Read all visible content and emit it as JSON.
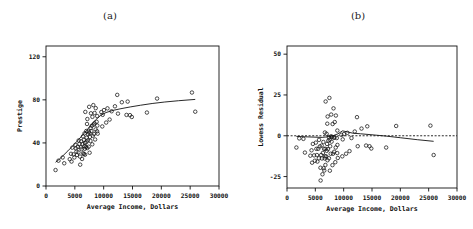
{
  "figure": {
    "background": "#ffffff",
    "ink": "#111111",
    "panel_a_label": "(a)",
    "panel_b_label": "(b)"
  },
  "chart_data": [
    {
      "type": "scatter",
      "title": "(a)",
      "xlabel": "Average Income, Dollars",
      "ylabel": "Prestige",
      "xlim": [
        0,
        30000
      ],
      "ylim": [
        0,
        130
      ],
      "xticks": [
        0,
        5000,
        10000,
        15000,
        20000,
        25000,
        30000
      ],
      "xticklabels": [
        "0",
        "5000",
        "10000",
        "15000",
        "20000",
        "25000",
        "30000"
      ],
      "yticks": [
        0,
        40,
        80,
        120
      ],
      "yticklabels": [
        "0",
        "40",
        "80",
        "120"
      ],
      "grid": false,
      "legend": "none",
      "marker": "open-circle",
      "x": [
        1656,
        2160,
        2896,
        3161,
        4120,
        4330,
        4426,
        4562,
        4783,
        4913,
        5092,
        5180,
        5277,
        5370,
        5511,
        5630,
        5658,
        5795,
        5902,
        5931,
        6033,
        6112,
        6162,
        6258,
        6336,
        6416,
        6462,
        6547,
        6573,
        6664,
        6686,
        6731,
        6776,
        6795,
        6817,
        6914,
        6992,
        7004,
        7059,
        7109,
        7147,
        7170,
        7224,
        7288,
        7396,
        7405,
        7482,
        7534,
        7562,
        7620,
        7709,
        7751,
        7796,
        7869,
        7936,
        8022,
        8049,
        8117,
        8206,
        8258,
        8316,
        8403,
        8425,
        8518,
        8597,
        8622,
        8780,
        8865,
        8880,
        8895,
        8965,
        9593,
        9758,
        9833,
        10051,
        10432,
        10660,
        11030,
        11377,
        11956,
        12351,
        12480,
        13149,
        13959,
        14163,
        14558,
        14878,
        17498,
        19263,
        25308,
        25879
      ],
      "y": [
        14.8,
        23.5,
        26.5,
        21.1,
        24.9,
        29.9,
        22.7,
        35.6,
        29.4,
        26.5,
        38.2,
        34.9,
        32.0,
        28.8,
        36.2,
        31.2,
        42.3,
        39.1,
        27.3,
        19.8,
        35.9,
        41.5,
        34.2,
        25.1,
        38.9,
        46.1,
        30.4,
        42.8,
        29.6,
        37.1,
        48.9,
        34.6,
        29.1,
        39.9,
        68.8,
        36.2,
        51.1,
        40.9,
        44.8,
        57.6,
        35.2,
        62.2,
        42.3,
        48.1,
        50.5,
        36.5,
        73.5,
        49.2,
        30.9,
        45.6,
        41.8,
        53.7,
        67.5,
        51.1,
        55.9,
        38.7,
        64.2,
        46.7,
        75.1,
        56.9,
        48.3,
        58.2,
        67.8,
        43.2,
        52.5,
        72.3,
        59.6,
        50.8,
        64.9,
        56.1,
        48.6,
        68.6,
        55.3,
        66.1,
        70.5,
        58.9,
        72.1,
        61.7,
        69.4,
        74.0,
        84.6,
        67.2,
        77.8,
        66.0,
        78.4,
        65.8,
        64.1,
        68.2,
        81.2,
        86.8,
        69.0
      ],
      "curve_name": "lowess smooth",
      "curve_x": [
        1656,
        2300,
        3000,
        3800,
        4600,
        5400,
        6200,
        7000,
        7800,
        8600,
        9400,
        10400,
        11600,
        13000,
        14600,
        16400,
        18400,
        20600,
        23000,
        25879
      ],
      "curve_y": [
        22.0,
        24.8,
        28.4,
        32.6,
        37.0,
        41.6,
        46.4,
        51.4,
        56.6,
        61.4,
        65.2,
        68.2,
        70.2,
        71.8,
        73.4,
        75.0,
        76.6,
        78.0,
        79.2,
        80.4
      ]
    },
    {
      "type": "scatter",
      "title": "(b)",
      "xlabel": "Average Income, Dollars",
      "ylabel": "Lowess Residual",
      "xlim": [
        0,
        30000
      ],
      "ylim": [
        -32,
        55
      ],
      "xticks": [
        0,
        5000,
        10000,
        15000,
        20000,
        25000,
        30000
      ],
      "xticklabels": [
        "0",
        "5000",
        "10000",
        "15000",
        "20000",
        "25000",
        "30000"
      ],
      "yticks": [
        -25,
        0,
        25,
        50
      ],
      "yticklabels": [
        "-25",
        "0",
        "25",
        "50"
      ],
      "grid": false,
      "legend": "none",
      "marker": "open-circle",
      "reference_line": {
        "y": 0,
        "style": "dashed"
      },
      "x": [
        1656,
        2160,
        2896,
        3161,
        4120,
        4330,
        4426,
        4562,
        4783,
        4913,
        5092,
        5180,
        5277,
        5370,
        5511,
        5630,
        5658,
        5795,
        5902,
        5931,
        6033,
        6112,
        6162,
        6258,
        6336,
        6416,
        6462,
        6547,
        6573,
        6664,
        6686,
        6731,
        6776,
        6795,
        6817,
        6914,
        6992,
        7004,
        7059,
        7109,
        7147,
        7170,
        7224,
        7288,
        7396,
        7405,
        7482,
        7534,
        7562,
        7620,
        7709,
        7751,
        7796,
        7869,
        7936,
        8022,
        8049,
        8117,
        8206,
        8258,
        8316,
        8403,
        8425,
        8518,
        8597,
        8622,
        8780,
        8865,
        8880,
        8895,
        8965,
        9593,
        9758,
        9833,
        10051,
        10432,
        10660,
        11030,
        11377,
        11956,
        12351,
        12480,
        13149,
        13959,
        14163,
        14558,
        14878,
        17498,
        19263,
        25308,
        25879
      ],
      "y": [
        -7.2,
        -1.6,
        -1.9,
        -10.3,
        -12.2,
        -8.9,
        -16.5,
        -5.0,
        -12.0,
        -15.3,
        -4.2,
        -8.0,
        -11.8,
        -15.8,
        -8.0,
        -13.8,
        -2.5,
        -6.5,
        -19.6,
        -27.4,
        -11.8,
        -6.0,
        -13.9,
        -23.6,
        -10.5,
        -3.8,
        -19.9,
        -8.0,
        -21.3,
        -13.9,
        2.0,
        -12.6,
        -17.9,
        -8.0,
        21.0,
        -12.6,
        1.2,
        -9.2,
        -5.0,
        7.4,
        -15.0,
        11.8,
        -8.2,
        -3.0,
        -1.0,
        -13.8,
        23.2,
        -2.5,
        -21.4,
        -6.4,
        -11.0,
        -0.4,
        13.0,
        -3.6,
        -0.6,
        -18.0,
        7.2,
        -11.0,
        16.8,
        -1.2,
        -9.8,
        -1.1,
        8.4,
        -16.2,
        -7.2,
        12.4,
        -1.4,
        -10.6,
        3.2,
        -5.6,
        -13.6,
        0.6,
        -12.6,
        -2.2,
        1.0,
        -11.0,
        1.8,
        -9.4,
        -1.4,
        2.6,
        11.4,
        -6.4,
        4.4,
        -6.0,
        5.8,
        -6.4,
        -7.8,
        -7.2,
        6.0,
        6.2,
        -11.8
      ],
      "curve_name": "lowess smooth of residuals",
      "curve_x": [
        1656,
        3000,
        4600,
        6200,
        7800,
        9000,
        9800,
        10600,
        11600,
        13000,
        15000,
        17500,
        20000,
        23000,
        25879
      ],
      "curve_y": [
        -0.4,
        -0.6,
        -0.8,
        -1.0,
        -0.4,
        1.2,
        3.0,
        2.4,
        1.6,
        1.2,
        0.6,
        -0.2,
        -1.2,
        -2.4,
        -3.4
      ]
    }
  ]
}
